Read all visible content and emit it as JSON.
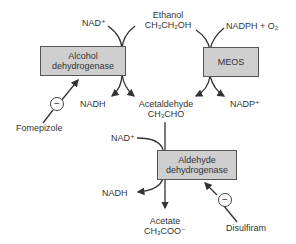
{
  "diagram": {
    "nodes": {
      "ethanol": {
        "name": "Ethanol",
        "formula": "CH₃CH₂OH"
      },
      "acetaldehyde": {
        "name": "Acetaldehyde",
        "formula": "CH₃CHO"
      },
      "acetate": {
        "name": "Acetate",
        "formula": "CH₃COO⁻"
      }
    },
    "enzymes": {
      "adh": {
        "line1": "Alcohol",
        "line2": "dehydrogenase"
      },
      "meos": {
        "label": "MEOS"
      },
      "aldh": {
        "line1": "Aldehyde",
        "line2": "dehydrogenase"
      }
    },
    "cofactors": {
      "nad_in_1": "NAD⁺",
      "nadh_out_1": "NADH",
      "nadph_in": "NADPH + O₂",
      "nadp_out": "NADP⁺",
      "nad_in_2": "NAD⁺",
      "nadh_out_2": "NADH"
    },
    "inhibitors": {
      "fomepizole": {
        "label": "Fomepizole",
        "symbol": "−",
        "target": "Alcohol dehydrogenase"
      },
      "disulfiram": {
        "label": "Disulfiram",
        "symbol": "−",
        "target": "Aldehyde dehydrogenase"
      }
    },
    "colors": {
      "box_fill": "#cfcfcf",
      "box_border": "#555555",
      "line": "#333333",
      "text": "#333333"
    }
  }
}
